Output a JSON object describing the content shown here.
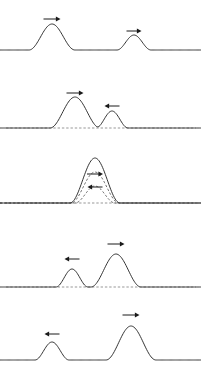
{
  "figure": {
    "width": 201,
    "height": 375,
    "background_color": "#ffffff",
    "curve_color": "#2a2a2a",
    "dashed_color": "#4a4a4a",
    "arrow_color": "#1a1a1a",
    "panel_count": 5
  },
  "panels": [
    {
      "index": 1,
      "name": "panel-pulses-approaching-far",
      "caption": "",
      "baseline_y": 50,
      "baseline_style": "solid",
      "pulses": [
        {
          "name": "large-pulse",
          "center_x": 52,
          "amplitude": 26,
          "width": 46,
          "style": "solid",
          "arrow": {
            "direction": "right",
            "x": 52,
            "y": 19,
            "length": 17
          }
        },
        {
          "name": "small-pulse",
          "center_x": 134,
          "amplitude": 15,
          "width": 34,
          "style": "solid",
          "arrow": {
            "direction": "right",
            "x": 134,
            "y": 31,
            "length": 15
          }
        }
      ]
    },
    {
      "index": 2,
      "name": "panel-pulses-overlapping-start",
      "caption": "",
      "baseline_y": 128,
      "baseline_style": "dashed",
      "pulses": [
        {
          "name": "large-pulse",
          "center_x": 75,
          "amplitude": 31,
          "width": 50,
          "style": "solid",
          "arrow": {
            "direction": "right",
            "x": 75,
            "y": 93,
            "length": 17
          }
        },
        {
          "name": "small-pulse",
          "center_x": 112,
          "amplitude": 17,
          "width": 32,
          "style": "solid",
          "arrow": {
            "direction": "left",
            "x": 112,
            "y": 106,
            "length": 15
          }
        }
      ]
    },
    {
      "index": 3,
      "name": "panel-constructive-interference",
      "caption": "",
      "baseline_y": 203,
      "baseline_style": "dashed",
      "pulses": [
        {
          "name": "resultant-sum-pulse",
          "center_x": 95,
          "amplitude": 45,
          "width": 50,
          "style": "solid",
          "arrow": null
        },
        {
          "name": "component-pulse-large",
          "center_x": 95,
          "amplitude": 31,
          "width": 48,
          "style": "dashed",
          "arrow": {
            "direction": "right",
            "x": 95,
            "y": 174,
            "length": 16
          }
        },
        {
          "name": "component-pulse-small",
          "center_x": 95,
          "amplitude": 17,
          "width": 40,
          "style": "dashed",
          "arrow": {
            "direction": "left",
            "x": 95,
            "y": 187,
            "length": 15
          }
        }
      ]
    },
    {
      "index": 4,
      "name": "panel-pulses-separating",
      "caption": "",
      "baseline_y": 287,
      "baseline_style": "dashed",
      "pulses": [
        {
          "name": "small-pulse",
          "center_x": 72,
          "amplitude": 18,
          "width": 32,
          "style": "solid",
          "arrow": {
            "direction": "left",
            "x": 72,
            "y": 259,
            "length": 15
          }
        },
        {
          "name": "large-pulse",
          "center_x": 116,
          "amplitude": 33,
          "width": 50,
          "style": "solid",
          "arrow": {
            "direction": "right",
            "x": 116,
            "y": 244,
            "length": 17
          }
        }
      ]
    },
    {
      "index": 5,
      "name": "panel-pulses-separated-far",
      "caption": "",
      "baseline_y": 360,
      "baseline_style": "solid",
      "pulses": [
        {
          "name": "small-pulse",
          "center_x": 52,
          "amplitude": 18,
          "width": 34,
          "style": "solid",
          "arrow": {
            "direction": "left",
            "x": 52,
            "y": 334,
            "length": 15
          }
        },
        {
          "name": "large-pulse",
          "center_x": 131,
          "amplitude": 34,
          "width": 50,
          "style": "solid",
          "arrow": {
            "direction": "right",
            "x": 131,
            "y": 315,
            "length": 17
          }
        }
      ]
    }
  ]
}
